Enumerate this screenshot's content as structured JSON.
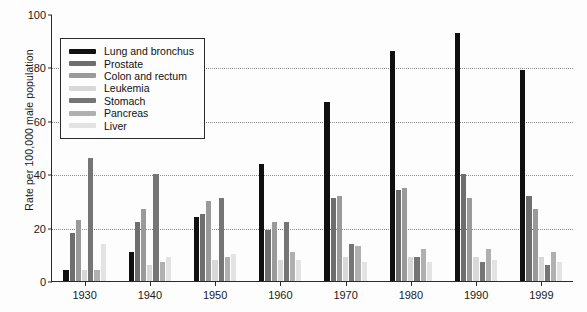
{
  "chart_data": {
    "type": "bar",
    "title": "",
    "subtitle": "",
    "xlabel": "",
    "ylabel": "Rate per 100,000 male population",
    "ylim": [
      0,
      100
    ],
    "yticks": [
      0,
      20,
      40,
      60,
      80,
      100
    ],
    "grid": true,
    "grid_axis": "y",
    "legend_position": "top-left",
    "categories": [
      "1930",
      "1940",
      "1950",
      "1960",
      "1970",
      "1980",
      "1990",
      "1999"
    ],
    "series": [
      {
        "name": "Lung and bronchus",
        "color": "#101010",
        "values": [
          4,
          11,
          24,
          44,
          67,
          86,
          93,
          79
        ]
      },
      {
        "name": "Prostate",
        "color": "#6e6e6e",
        "values": [
          18,
          22,
          25,
          19,
          31,
          34,
          40,
          32
        ]
      },
      {
        "name": "Colon and rectum",
        "color": "#9a9a9a",
        "values": [
          23,
          27,
          30,
          22,
          32,
          35,
          31,
          27
        ]
      },
      {
        "name": "Leukemia",
        "color": "#d8d8d8",
        "values": [
          4,
          6,
          8,
          8,
          9,
          9,
          9,
          9
        ]
      },
      {
        "name": "Stomach",
        "color": "#757575",
        "values": [
          46,
          40,
          31,
          22,
          14,
          9,
          7,
          6
        ]
      },
      {
        "name": "Pancreas",
        "color": "#b0b0b0",
        "values": [
          4,
          7,
          9,
          11,
          13,
          12,
          12,
          11
        ]
      },
      {
        "name": "Liver",
        "color": "#e3e3e3",
        "values": [
          14,
          9,
          10,
          8,
          7,
          7,
          8,
          7
        ]
      }
    ]
  },
  "colors": {
    "background": "#fdfdfd",
    "axis": "#2a2a2a",
    "grid": "#8c8c8c",
    "text": "#1a1a1a"
  }
}
